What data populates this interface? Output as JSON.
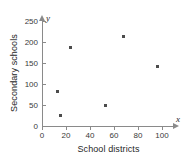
{
  "chart_data": {
    "type": "scatter",
    "title": "",
    "xlabel": "School districts",
    "ylabel": "Secondary schools",
    "x_axis_variable": "x",
    "y_axis_variable": "y",
    "xlim": [
      0,
      110
    ],
    "ylim": [
      0,
      265
    ],
    "xticks": [
      0,
      20,
      40,
      60,
      80,
      100
    ],
    "yticks": [
      0,
      50,
      100,
      150,
      200,
      250
    ],
    "xtick_labels": [
      "0",
      "20",
      "40",
      "60",
      "80",
      "100"
    ],
    "ytick_labels": [
      "0",
      "50",
      "100",
      "150",
      "200",
      "250"
    ],
    "grid": false,
    "legend": false,
    "marker_color": "#4c4c4c",
    "axis_color": "#8a8a8a",
    "points": [
      {
        "x": 13,
        "y": 83
      },
      {
        "x": 15,
        "y": 26
      },
      {
        "x": 24,
        "y": 186
      },
      {
        "x": 53,
        "y": 49
      },
      {
        "x": 68,
        "y": 214
      },
      {
        "x": 96,
        "y": 142
      }
    ]
  }
}
